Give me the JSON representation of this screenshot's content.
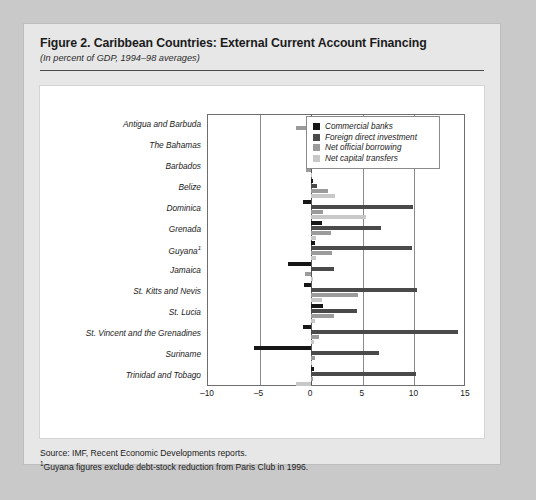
{
  "figure": {
    "title": "Figure 2.  Caribbean Countries: External Current Account Financing",
    "subtitle": "(In percent of GDP, 1994–98 averages)",
    "source_note": "Source: IMF, Recent Economic Developments reports.",
    "footnote_marker": "1",
    "footnote_text": "Guyana figures exclude debt-stock reduction from Paris Club in 1996."
  },
  "colors": {
    "commercial_banks": "#161616",
    "foreign_direct_investment": "#4a4a4a",
    "net_official_borrowing": "#9b9b9b",
    "net_capital_transfers": "#c8c8c8",
    "frame": "#6e6e6e",
    "grid": "#8a8a8a",
    "card_background": "#e7e7e7",
    "plot_background": "#ffffff",
    "page_background": "#c9c9c9"
  },
  "chart_data": {
    "type": "bar",
    "orientation": "horizontal",
    "title": "Figure 2.  Caribbean Countries: External Current Account Financing",
    "subtitle": "(In percent of GDP, 1994–98 averages)",
    "xlabel": "",
    "ylabel": "",
    "xlim": [
      -10,
      15
    ],
    "xticks": [
      -10,
      -5,
      0,
      5,
      10,
      15
    ],
    "xticklabels": [
      "–10",
      "–5",
      "0",
      "5",
      "10",
      "15"
    ],
    "grid": true,
    "legend_position": "top-right",
    "categories": [
      "Antigua and Barbuda",
      "The Bahamas",
      "Barbados",
      "Belize",
      "Dominica",
      "Grenada",
      "Guyana",
      "Jamaica",
      "St. Kitts and Nevis",
      "St. Lucia",
      "St. Vincent and the Grenadines",
      "Suriname",
      "Trinidad and Tobago"
    ],
    "category_footnotes": {
      "Guyana": "1"
    },
    "series": [
      {
        "name": "Commercial banks",
        "color": "#161616",
        "values": [
          1.6,
          1.1,
          1.6,
          0.2,
          -0.8,
          1.0,
          0.4,
          -2.2,
          -0.7,
          1.1,
          -0.8,
          -5.5,
          0.3
        ]
      },
      {
        "name": "Foreign direct investment",
        "color": "#4a4a4a",
        "values": [
          4.6,
          2.6,
          1.3,
          0.6,
          9.9,
          6.8,
          9.8,
          2.2,
          10.3,
          4.4,
          14.2,
          6.6,
          10.2
        ]
      },
      {
        "name": "Net official borrowing",
        "color": "#9b9b9b",
        "values": [
          -1.5,
          -0.3,
          -0.5,
          1.6,
          1.1,
          1.9,
          2.0,
          -0.6,
          4.5,
          2.2,
          0.8,
          0.4,
          0.2
        ]
      },
      {
        "name": "Net capital transfers",
        "color": "#c8c8c8",
        "values": [
          0.6,
          0.1,
          0.1,
          2.3,
          5.3,
          0.5,
          0.5,
          0.2,
          1.0,
          0.4,
          0.3,
          0.1,
          -1.5
        ]
      }
    ]
  },
  "legend": {
    "items": [
      {
        "label": "Commercial banks",
        "color": "#161616"
      },
      {
        "label": "Foreign direct investment",
        "color": "#4a4a4a"
      },
      {
        "label": "Net official borrowing",
        "color": "#9b9b9b"
      },
      {
        "label": "Net capital transfers",
        "color": "#c8c8c8"
      }
    ]
  }
}
